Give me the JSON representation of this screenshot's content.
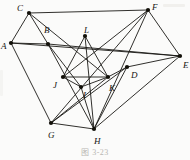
{
  "figure": {
    "caption": "图 3-23",
    "background_color": "#fbfbfa",
    "edge_color": "#1a1815",
    "vertex_color": "#121009",
    "label_color": "#15130f"
  },
  "graph_data": {
    "type": "node-link-diagram",
    "directed": false,
    "vertex_count": 12,
    "edge_count": 24,
    "vertices": [
      {
        "id": "A",
        "label": "A",
        "x": 11,
        "y": 43,
        "label_dx": -10,
        "label_dy": 4
      },
      {
        "id": "B",
        "label": "B",
        "x": 48,
        "y": 44,
        "label_dx": -4,
        "label_dy": -13
      },
      {
        "id": "C",
        "label": "C",
        "x": 29,
        "y": 13,
        "label_dx": -12,
        "label_dy": -4
      },
      {
        "id": "D",
        "label": "D",
        "x": 127,
        "y": 67,
        "label_dx": 4,
        "label_dy": 9
      },
      {
        "id": "E",
        "label": "E",
        "x": 180,
        "y": 56,
        "label_dx": 3,
        "label_dy": 10
      },
      {
        "id": "F",
        "label": "F",
        "x": 148,
        "y": 10,
        "label_dx": 4,
        "label_dy": -2
      },
      {
        "id": "G",
        "label": "G",
        "x": 51,
        "y": 123,
        "label_dx": -3,
        "label_dy": 13
      },
      {
        "id": "H",
        "label": "H",
        "x": 94,
        "y": 129,
        "label_dx": 0,
        "label_dy": 13
      },
      {
        "id": "I",
        "label": "I",
        "x": 81,
        "y": 87,
        "label_dx": 2,
        "label_dy": 9
      },
      {
        "id": "J",
        "label": "J",
        "x": 63,
        "y": 77,
        "label_dx": -10,
        "label_dy": 9
      },
      {
        "id": "K",
        "label": "K",
        "x": 108,
        "y": 77,
        "label_dx": 1,
        "label_dy": 12
      },
      {
        "id": "L",
        "label": "L",
        "x": 85,
        "y": 36,
        "label_dx": -1,
        "label_dy": -5
      }
    ],
    "edges": [
      {
        "source": "A",
        "target": "C"
      },
      {
        "source": "A",
        "target": "B"
      },
      {
        "source": "A",
        "target": "E"
      },
      {
        "source": "A",
        "target": "G"
      },
      {
        "source": "C",
        "target": "B"
      },
      {
        "source": "C",
        "target": "F"
      },
      {
        "source": "C",
        "target": "K"
      },
      {
        "source": "B",
        "target": "E"
      },
      {
        "source": "B",
        "target": "I"
      },
      {
        "source": "B",
        "target": "H"
      },
      {
        "source": "F",
        "target": "E"
      },
      {
        "source": "F",
        "target": "G"
      },
      {
        "source": "F",
        "target": "H"
      },
      {
        "source": "F",
        "target": "J"
      },
      {
        "source": "E",
        "target": "D"
      },
      {
        "source": "E",
        "target": "H"
      },
      {
        "source": "D",
        "target": "K"
      },
      {
        "source": "D",
        "target": "G"
      },
      {
        "source": "L",
        "target": "J"
      },
      {
        "source": "L",
        "target": "K"
      },
      {
        "source": "J",
        "target": "K"
      },
      {
        "source": "J",
        "target": "I"
      },
      {
        "source": "I",
        "target": "K"
      },
      {
        "source": "I",
        "target": "H"
      },
      {
        "source": "G",
        "target": "H"
      },
      {
        "source": "G",
        "target": "K"
      },
      {
        "source": "H",
        "target": "L"
      },
      {
        "source": "H",
        "target": "D"
      }
    ]
  }
}
